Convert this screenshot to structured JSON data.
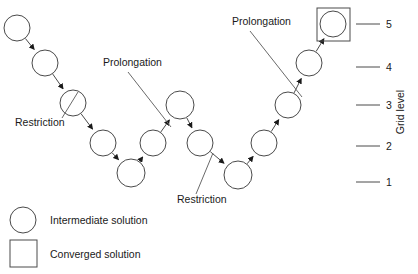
{
  "diagram": {
    "stroke_color": "#4a4a4a",
    "text_color": "#1a1a1a",
    "nodes": [
      {
        "id": "n1",
        "name": "intermediate-solution-node-1",
        "cx": 17,
        "cy": 28,
        "r": 13,
        "shape": "circle",
        "level": 5
      },
      {
        "id": "n2",
        "name": "intermediate-solution-node-2",
        "cx": 45,
        "cy": 63,
        "r": 13,
        "shape": "circle",
        "level": 4
      },
      {
        "id": "n3",
        "name": "intermediate-solution-node-3",
        "cx": 73,
        "cy": 103,
        "r": 13,
        "shape": "circle",
        "level": 3
      },
      {
        "id": "n4",
        "name": "intermediate-solution-node-4",
        "cx": 103,
        "cy": 143,
        "r": 13,
        "shape": "circle",
        "level": 2
      },
      {
        "id": "n5",
        "name": "intermediate-solution-node-5",
        "cx": 131,
        "cy": 173,
        "r": 14,
        "shape": "circle",
        "level": 1
      },
      {
        "id": "n6",
        "name": "intermediate-solution-node-6",
        "cx": 153,
        "cy": 143,
        "r": 13,
        "shape": "circle",
        "level": 2
      },
      {
        "id": "n7",
        "name": "intermediate-solution-node-7",
        "cx": 180,
        "cy": 105,
        "r": 14,
        "shape": "circle",
        "level": 3
      },
      {
        "id": "n8",
        "name": "intermediate-solution-node-8",
        "cx": 200,
        "cy": 143,
        "r": 13,
        "shape": "circle",
        "level": 2
      },
      {
        "id": "n9",
        "name": "intermediate-solution-node-9",
        "cx": 238,
        "cy": 175,
        "r": 14,
        "shape": "circle",
        "level": 1
      },
      {
        "id": "n10",
        "name": "intermediate-solution-node-10",
        "cx": 264,
        "cy": 143,
        "r": 13,
        "shape": "circle",
        "level": 2
      },
      {
        "id": "n11",
        "name": "intermediate-solution-node-11",
        "cx": 288,
        "cy": 105,
        "r": 13,
        "shape": "circle",
        "level": 3
      },
      {
        "id": "n12",
        "name": "intermediate-solution-node-12",
        "cx": 309,
        "cy": 63,
        "r": 13,
        "shape": "circle",
        "level": 4
      },
      {
        "id": "n13",
        "name": "converged-solution-node",
        "cx": 333,
        "cy": 24,
        "r": 13,
        "shape": "circle-in-square",
        "box": {
          "x": 317,
          "y": 8,
          "w": 33,
          "h": 33
        },
        "level": 5
      }
    ],
    "edges": [
      {
        "name": "edge-n1-n2",
        "from": "n1",
        "to": "n2"
      },
      {
        "name": "edge-n2-n3",
        "from": "n2",
        "to": "n3"
      },
      {
        "name": "edge-n3-n4",
        "from": "n3",
        "to": "n4"
      },
      {
        "name": "edge-n4-n5",
        "from": "n4",
        "to": "n5"
      },
      {
        "name": "edge-n5-n6",
        "from": "n5",
        "to": "n6"
      },
      {
        "name": "edge-n6-n7",
        "from": "n6",
        "to": "n7"
      },
      {
        "name": "edge-n7-n8",
        "from": "n7",
        "to": "n8"
      },
      {
        "name": "edge-n8-n9",
        "from": "n8",
        "to": "n9"
      },
      {
        "name": "edge-n9-n10",
        "from": "n9",
        "to": "n10"
      },
      {
        "name": "edge-n10-n11",
        "from": "n10",
        "to": "n11"
      },
      {
        "name": "edge-n11-n12",
        "from": "n11",
        "to": "n12"
      },
      {
        "name": "edge-n12-n13",
        "from": "n12",
        "to": "n13"
      }
    ],
    "annotations": [
      {
        "id": "a1",
        "name": "annotation-restriction-left",
        "text": "Restriction",
        "text_x": 15,
        "text_y": 126,
        "leader": {
          "x1": 62,
          "y1": 118,
          "x2": 78,
          "y2": 92
        }
      },
      {
        "id": "a2",
        "name": "annotation-prolongation-middle",
        "text": "Prolongation",
        "text_x": 103,
        "text_y": 66,
        "leader": {
          "x1": 128,
          "y1": 72,
          "x2": 171,
          "y2": 127
        }
      },
      {
        "id": "a3",
        "name": "annotation-restriction-right",
        "text": "Restriction",
        "text_x": 177,
        "text_y": 203,
        "leader": {
          "x1": 196,
          "y1": 194,
          "x2": 213,
          "y2": 153
        }
      },
      {
        "id": "a4",
        "name": "annotation-prolongation-top",
        "text": "Prolongation",
        "text_x": 232,
        "text_y": 25,
        "leader": {
          "x1": 250,
          "y1": 31,
          "x2": 302,
          "y2": 97
        }
      }
    ],
    "axis": {
      "title": "Grid level",
      "title_x": 404,
      "title_y": 112,
      "ticks": [
        {
          "name": "grid-level-tick-5",
          "label": "5",
          "y": 24,
          "x1": 356,
          "x2": 380,
          "label_x": 386
        },
        {
          "name": "grid-level-tick-4",
          "label": "4",
          "y": 67,
          "x1": 356,
          "x2": 380,
          "label_x": 386
        },
        {
          "name": "grid-level-tick-3",
          "label": "3",
          "y": 105,
          "x1": 356,
          "x2": 380,
          "label_x": 386
        },
        {
          "name": "grid-level-tick-2",
          "label": "2",
          "y": 146,
          "x1": 356,
          "x2": 380,
          "label_x": 386
        },
        {
          "name": "grid-level-tick-1",
          "label": "1",
          "y": 182,
          "x1": 356,
          "x2": 380,
          "label_x": 386
        }
      ]
    },
    "legend": [
      {
        "name": "legend-item-intermediate",
        "shape": "circle",
        "label": "Intermediate solution",
        "cx": 23,
        "cy": 220,
        "r": 13,
        "label_x": 50,
        "label_y": 224
      },
      {
        "name": "legend-item-converged",
        "shape": "square",
        "label": "Converged solution",
        "box": {
          "x": 10,
          "y": 240,
          "w": 27,
          "h": 27
        },
        "label_x": 50,
        "label_y": 258
      }
    ]
  }
}
